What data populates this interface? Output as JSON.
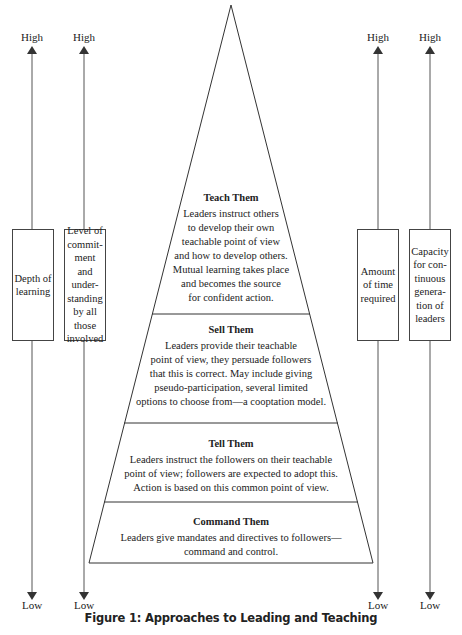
{
  "figure": {
    "caption": "Figure 1: Approaches to Leading and Teaching"
  },
  "axes": [
    {
      "high": "High",
      "low": "Low",
      "label": "Depth of learning",
      "lines": [
        "Depth of",
        "learning"
      ]
    },
    {
      "high": "High",
      "low": "Low",
      "label": "Level of commitment and understanding by all those involved",
      "lines": [
        "Level of",
        "commit-",
        "ment and",
        "under-",
        "standing",
        "by all",
        "those",
        "involved"
      ]
    },
    {
      "high": "High",
      "low": "Low",
      "label": "Amount of time required",
      "lines": [
        "Amount",
        "of time",
        "required"
      ]
    },
    {
      "high": "High",
      "low": "Low",
      "label": "Capacity for continuous generation of leaders",
      "lines": [
        "Capacity",
        "for con-",
        "tinuous",
        "genera-",
        "tion of",
        "leaders"
      ]
    }
  ],
  "pyramid": {
    "tiers": [
      {
        "title": "Teach Them",
        "lines": [
          "Leaders instruct others",
          "to develop their own",
          "teachable point of view",
          "and how to develop others.",
          "Mutual learning takes place",
          "and becomes the source",
          "for confident action."
        ]
      },
      {
        "title": "Sell Them",
        "lines": [
          "Leaders provide their teachable",
          "point of view, they persuade followers",
          "that this is correct. May include giving",
          "pseudo-participation, several limited",
          "options to choose from—a cooptation model."
        ]
      },
      {
        "title": "Tell Them",
        "lines": [
          "Leaders instruct the followers on their teachable",
          "point of view; followers are expected to adopt this.",
          "Action is based on this common point of view."
        ]
      },
      {
        "title": "Command Them",
        "lines": [
          "Leaders give mandates and directives to followers—",
          "command and control."
        ]
      }
    ]
  }
}
